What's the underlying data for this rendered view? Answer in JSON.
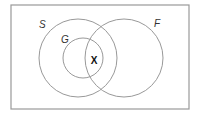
{
  "diagram": {
    "type": "venn",
    "universe": {
      "x": 11,
      "y": 5,
      "width": 178,
      "height": 104,
      "stroke": "#999999"
    },
    "sets": [
      {
        "id": "S",
        "label": "S",
        "cx": 78,
        "cy": 58,
        "r": 39,
        "label_x": 39,
        "label_y": 28
      },
      {
        "id": "G",
        "label": "G",
        "cx": 83,
        "cy": 58,
        "r": 20,
        "label_x": 61,
        "label_y": 43
      },
      {
        "id": "F",
        "label": "F",
        "cx": 124,
        "cy": 58,
        "r": 39,
        "label_x": 154,
        "label_y": 27
      }
    ],
    "marker": {
      "text": "X",
      "x": 94,
      "y": 64
    },
    "circle_stroke": "#999999"
  }
}
